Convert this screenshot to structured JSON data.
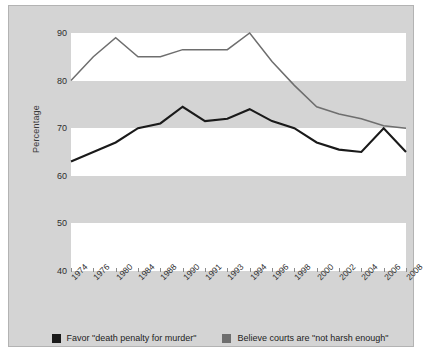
{
  "chart_data": {
    "type": "line",
    "title": "",
    "subtitle": "",
    "xlabel": "",
    "ylabel": "Percentage",
    "ylim": [
      40,
      90
    ],
    "yticks": [
      90,
      80,
      70,
      60,
      50,
      40
    ],
    "grid": false,
    "banded_background": true,
    "legend_position": "bottom",
    "x": [
      "1974",
      "1976",
      "1980",
      "1984",
      "1988",
      "1990",
      "1991",
      "1993",
      "1994",
      "1996",
      "1998",
      "2000",
      "2002",
      "2004",
      "2006",
      "2008"
    ],
    "categories": [
      "1974",
      "1976",
      "1980",
      "1984",
      "1988",
      "1990",
      "1991",
      "1993",
      "1994",
      "1996",
      "1998",
      "2000",
      "2002",
      "2004",
      "2006",
      "2008"
    ],
    "series": [
      {
        "name": "Favor \"death penalty for murder\"",
        "color": "#1a1a1a",
        "values": [
          63,
          65,
          67,
          70,
          71,
          74.5,
          71.5,
          72,
          74,
          71.5,
          70,
          67,
          65.5,
          65,
          70,
          65
        ]
      },
      {
        "name": "Believe courts are \"not harsh enough\"",
        "color": "#6e6e6e",
        "values": [
          80,
          85,
          89,
          85,
          85,
          86.5,
          86.5,
          86.5,
          90,
          84,
          79,
          74.5,
          73,
          72,
          70.5,
          70
        ]
      }
    ]
  },
  "axes": {
    "y_title": "Percentage",
    "y_tick_labels": [
      "90",
      "80",
      "70",
      "60",
      "50",
      "40"
    ],
    "x_tick_labels": [
      "1974",
      "1976",
      "1980",
      "1984",
      "1988",
      "1990",
      "1991",
      "1993",
      "1994",
      "1996",
      "1998",
      "2000",
      "2002",
      "2004",
      "2006",
      "2008"
    ]
  },
  "legend": {
    "items": [
      {
        "label": "Favor \"death penalty for murder\"",
        "color": "#1a1a1a"
      },
      {
        "label": "Believe courts are \"not harsh enough\"",
        "color": "#6e6e6e"
      }
    ]
  },
  "colors": {
    "panel_background": "#d4d4d4",
    "panel_border": "#b3b3b3",
    "band_white": "#ffffff",
    "series_black": "#1a1a1a",
    "series_gray": "#6e6e6e",
    "text": "#2e2e2e"
  }
}
